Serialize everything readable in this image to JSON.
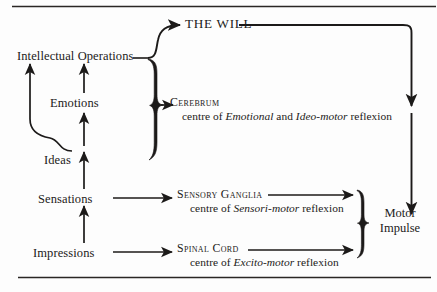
{
  "diagram": {
    "rules": {
      "top": true,
      "bottom": true
    },
    "ink_color": "#1c1a19",
    "background_color": "#fdfdfd"
  },
  "left_column": {
    "items": [
      {
        "id": "intellectual-operations",
        "label": "Intellectual Operations"
      },
      {
        "id": "emotions",
        "label": "Emotions"
      },
      {
        "id": "ideas",
        "label": "Ideas"
      },
      {
        "id": "sensations",
        "label": "Sensations"
      },
      {
        "id": "impressions",
        "label": "Impressions"
      }
    ]
  },
  "will": {
    "label": "THE WILL"
  },
  "centres": [
    {
      "id": "cerebrum",
      "name": "Cerebrum",
      "centre_prefix": "centre of ",
      "italic_one": "Emotional",
      "conjunction": " and ",
      "italic_two": "Ideo-motor",
      "suffix": " reflexion"
    },
    {
      "id": "sensory-ganglia",
      "name": "Sensory Ganglia",
      "centre_prefix": "centre of ",
      "italic_one": "Sensori-motor",
      "suffix": " reflexion"
    },
    {
      "id": "spinal-cord",
      "name": "Spinal Cord",
      "centre_prefix": "centre of ",
      "italic_one": "Excito-motor",
      "suffix": " reflexion"
    }
  ],
  "output": {
    "line_one": "Motor",
    "line_two": "Impulse"
  }
}
